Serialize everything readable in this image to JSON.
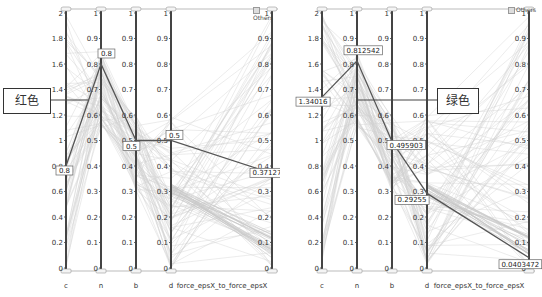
{
  "chart_data": [
    {
      "type": "parallel_coordinates",
      "panel": "left",
      "axes": [
        {
          "name": "c",
          "range": [
            0,
            2
          ],
          "ticks": [
            "0",
            "0.2",
            "0.4",
            "0.6",
            "0.8",
            "1",
            "1.2",
            "1.4",
            "1.6",
            "1.8",
            "2"
          ]
        },
        {
          "name": "n",
          "range": [
            0,
            1
          ],
          "ticks": [
            "0",
            "0.1",
            "0.2",
            "0.3",
            "0.4",
            "0.5",
            "0.6",
            "0.7",
            "0.8",
            "0.9",
            "1"
          ]
        },
        {
          "name": "b",
          "range": [
            0,
            1
          ],
          "ticks": [
            "0",
            "0.1",
            "0.2",
            "0.3",
            "0.4",
            "0.5",
            "0.6",
            "0.7",
            "0.8",
            "0.9",
            "1"
          ]
        },
        {
          "name": "d",
          "range": [
            0,
            1
          ],
          "ticks": [
            "0",
            "0.1",
            "0.2",
            "0.3",
            "0.4",
            "0.5",
            "0.6",
            "0.7",
            "0.8",
            "0.9",
            "1"
          ]
        },
        {
          "name": "force_epsX_to_force_epsX",
          "range": [
            0,
            1
          ],
          "ticks": [
            "0",
            "0.1",
            "0.2",
            "0.3",
            "0.4",
            "0.5",
            "0.6",
            "0.7",
            "0.8",
            "0.9",
            "1"
          ]
        }
      ],
      "legend": [
        "Others"
      ],
      "highlighted_series": {
        "name": "红色",
        "values": {
          "c": 0.8,
          "n": 0.8,
          "b": 0.5,
          "d": 0.5,
          "force_epsX_to_force_epsX": 0.371272
        },
        "labels": [
          "0.8",
          "0.8",
          "0.5",
          "0.5",
          "0.371272"
        ]
      },
      "annotation": "红色"
    },
    {
      "type": "parallel_coordinates",
      "panel": "right",
      "axes": [
        {
          "name": "c",
          "range": [
            0,
            2
          ],
          "ticks": [
            "0",
            "0.2",
            "0.4",
            "0.6",
            "0.8",
            "1",
            "1.2",
            "1.4",
            "1.6",
            "1.8",
            "2"
          ]
        },
        {
          "name": "n",
          "range": [
            0,
            1
          ],
          "ticks": [
            "0",
            "0.1",
            "0.2",
            "0.3",
            "0.4",
            "0.5",
            "0.6",
            "0.7",
            "0.8",
            "0.9",
            "1"
          ]
        },
        {
          "name": "b",
          "range": [
            0,
            1
          ],
          "ticks": [
            "0",
            "0.1",
            "0.2",
            "0.3",
            "0.4",
            "0.5",
            "0.6",
            "0.7",
            "0.8",
            "0.9",
            "1"
          ]
        },
        {
          "name": "d",
          "range": [
            0,
            1
          ],
          "ticks": [
            "0",
            "0.1",
            "0.2",
            "0.3",
            "0.4",
            "0.5",
            "0.6",
            "0.7",
            "0.8",
            "0.9",
            "1"
          ]
        },
        {
          "name": "force_epsX_to_force_epsX",
          "range": [
            0,
            1
          ],
          "ticks": [
            "0",
            "0.1",
            "0.2",
            "0.3",
            "0.4",
            "0.5",
            "0.6",
            "0.7",
            "0.8",
            "0.9",
            "1"
          ]
        }
      ],
      "legend": [
        "Others"
      ],
      "highlighted_series": {
        "name": "绿色",
        "values": {
          "c": 1.34016,
          "n": 0.812542,
          "b": 0.495903,
          "d": 0.29255,
          "force_epsX_to_force_epsX": 0.0403472
        },
        "labels": [
          "1.34016",
          "0.812542",
          "0.495903",
          "0.29255",
          "0.0403472"
        ]
      },
      "annotation": "绿色"
    }
  ],
  "left": {
    "callout": "红色",
    "legend": "Others",
    "axis_labels": [
      "c",
      "n",
      "b",
      "d",
      "force_epsX_to_force_epsX"
    ]
  },
  "right": {
    "callout": "绿色",
    "legend": "Others",
    "axis_labels": [
      "c",
      "n",
      "b",
      "d",
      "force_epsX_to_force_epsX"
    ]
  },
  "colors": {
    "axis": "#444444",
    "background_lines": "#d8d8d8",
    "highlight": "#555555"
  }
}
